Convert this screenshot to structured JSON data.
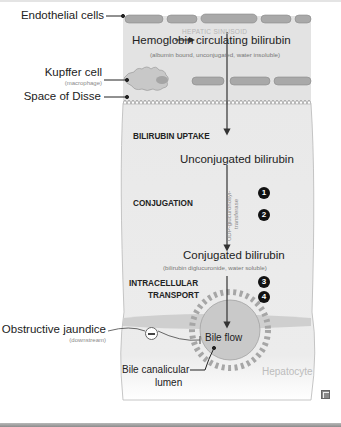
{
  "diagram": {
    "left_labels": {
      "endothelial": "Endothelial cells",
      "kupffer": "Kupffer cell",
      "kupffer_sub": "(macrophage)",
      "disse": "Space of Disse",
      "obstructive": "Obstructive jaundice",
      "obstructive_sub": "(downstream)"
    },
    "sinusoid": {
      "label": "HEPATIC SINUSOID",
      "hemoglobin": "Hemoglobin",
      "circulating": "circulating bilirubin",
      "circulating_sub": "(albumin bound, unconjugated, water insoluble)"
    },
    "stages": {
      "uptake": "BILIRUBIN UPTAKE",
      "conjugation": "CONJUGATION",
      "transport_line1": "INTRACELLULAR",
      "transport_line2": "TRANSPORT"
    },
    "flow": {
      "unconjugated": "Unconjugated bilirubin",
      "enzyme_line1": "UDP-glucuronosyl-",
      "enzyme_line2": "transferase",
      "conjugated": "Conjugated bilirubin",
      "conjugated_sub": "(bilirubin diglucuronide, water soluble)",
      "bile_flow": "Bile flow",
      "lumen_line1": "Bile canalicular",
      "lumen_line2": "lumen",
      "hepatocyte": "Hepatocyte"
    },
    "markers": [
      "1",
      "2",
      "3",
      "4"
    ],
    "colors": {
      "sinusoid_bg": "#e6e6e6",
      "cell_fill": "#a9a9a9",
      "hepatocyte_bg": "#ececec",
      "lumen_fill": "#cfcfcf",
      "arrow": "#333333"
    }
  }
}
